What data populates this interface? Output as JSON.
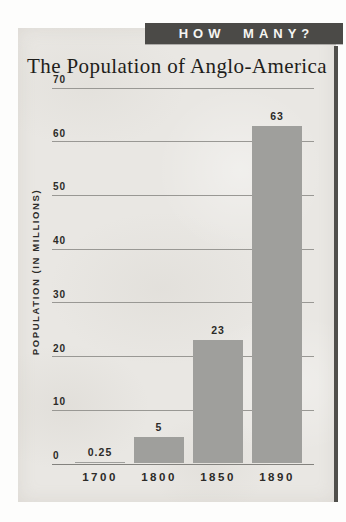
{
  "banner": {
    "label": "HOW MANY?",
    "bg_color": "#4b4a47",
    "text_color": "#f6f5f2"
  },
  "chart_data": {
    "type": "bar",
    "title": "The Population of Anglo-America",
    "ylabel": "POPULATION (IN MILLIONS)",
    "xlabel": "",
    "categories": [
      "1700",
      "1800",
      "1850",
      "1890"
    ],
    "values": [
      0.25,
      5,
      23,
      63
    ],
    "value_labels": [
      "0.25",
      "5",
      "23",
      "63"
    ],
    "yticks": [
      0,
      10,
      20,
      30,
      40,
      50,
      60,
      70
    ],
    "ylim": [
      0,
      70
    ],
    "grid": "horizontal-lines",
    "legend": "none",
    "bar_color": "#9f9f9c",
    "background_color": "#e9e7e3",
    "gridline_color": "#999894"
  }
}
